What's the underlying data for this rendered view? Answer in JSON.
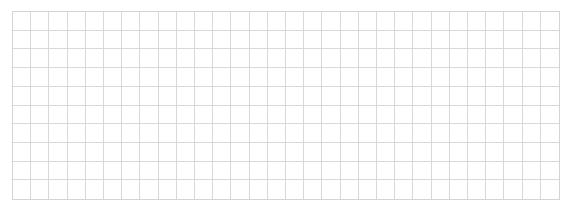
{
  "grid": {
    "columns": 30,
    "rows": 10,
    "line_color": "#d9d9d9",
    "background": "#ffffff"
  }
}
